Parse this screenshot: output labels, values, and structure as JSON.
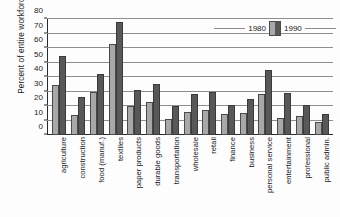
{
  "chart_data": {
    "type": "bar",
    "title": "",
    "xlabel": "",
    "ylabel": "Percent of entire workforce",
    "ylim": [
      0,
      80
    ],
    "yticks": [
      0,
      10,
      20,
      30,
      40,
      50,
      60,
      70,
      80
    ],
    "grid": true,
    "legend_position": "top-right",
    "categories": [
      "agriculture",
      "construction",
      "food (manuf.)",
      "textiles",
      "paper products",
      "durable goods",
      "transportation",
      "wholesale",
      "retail",
      "finance",
      "business",
      "personal service",
      "entertainment",
      "professional",
      "public admin."
    ],
    "series": [
      {
        "name": "1980",
        "color": "#a8a8a8",
        "values": [
          34.5,
          14,
          29.5,
          62.5,
          20,
          23,
          11,
          16,
          17,
          14.5,
          15.5,
          28,
          11.5,
          13,
          9
        ]
      },
      {
        "name": "1990",
        "color": "#585858",
        "values": [
          54.5,
          26,
          42,
          78,
          31,
          35,
          20,
          28.5,
          30,
          20.5,
          25,
          44.5,
          29,
          21,
          14.5
        ]
      }
    ]
  },
  "legend": {
    "items": [
      {
        "label": "1980"
      },
      {
        "label": "1990"
      }
    ]
  }
}
